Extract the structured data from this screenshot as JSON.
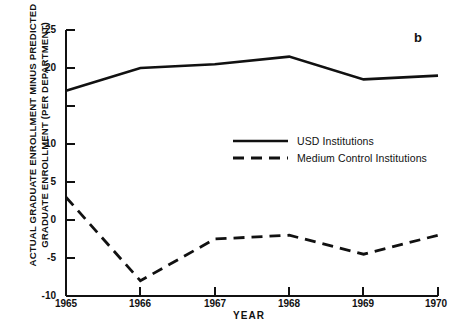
{
  "panel": {
    "letter": "b"
  },
  "axes": {
    "ylabel_line1": "ACTUAL GRADUATE ENROLLMENT MINUS PREDICTED",
    "ylabel_line2": "GRADUATE ENROLLMENT (PER DEPARTMENT)",
    "xlabel": "YEAR",
    "ytick_25": "25",
    "ytick_20": "20",
    "ytick_10": "10",
    "ytick_5": "5",
    "ytick_0": "0",
    "ytick_m5": "-5",
    "ytick_m10": "-10",
    "xtick_1965": "1965",
    "xtick_1966": "1966",
    "xtick_1967": "1967",
    "xtick_1968": "1968",
    "xtick_1969": "1969",
    "xtick_1970": "1970"
  },
  "legend": {
    "series1_label": "USD Institutions",
    "series2_label": "Medium Control Institutions"
  },
  "chart_data": {
    "type": "line",
    "title": "",
    "subtitle": "",
    "panel_label": "b",
    "xlabel": "YEAR",
    "ylabel": "ACTUAL GRADUATE ENROLLMENT MINUS PREDICTED GRADUATE ENROLLMENT (PER DEPARTMENT)",
    "x": [
      1965,
      1966,
      1967,
      1968,
      1969,
      1970
    ],
    "xticklabels": [
      "1965",
      "1966",
      "1967",
      "1968",
      "1969",
      "1970"
    ],
    "xlim": [
      1965,
      1970
    ],
    "ylim": [
      -10,
      25
    ],
    "yticks": [
      -10,
      -5,
      0,
      5,
      10,
      15,
      20,
      25
    ],
    "yticklabels": [
      "-10",
      "-5",
      "0",
      "5",
      "10",
      "",
      "20",
      "25"
    ],
    "grid": false,
    "legend_position": "center",
    "series": [
      {
        "name": "USD Institutions",
        "style": "solid",
        "color": "#111111",
        "values": [
          17.0,
          20.0,
          20.5,
          21.5,
          18.5,
          19.0
        ]
      },
      {
        "name": "Medium Control Institutions",
        "style": "dashed",
        "color": "#111111",
        "values": [
          3.0,
          -8.0,
          -2.5,
          -2.0,
          -4.5,
          -2.0
        ]
      }
    ]
  }
}
